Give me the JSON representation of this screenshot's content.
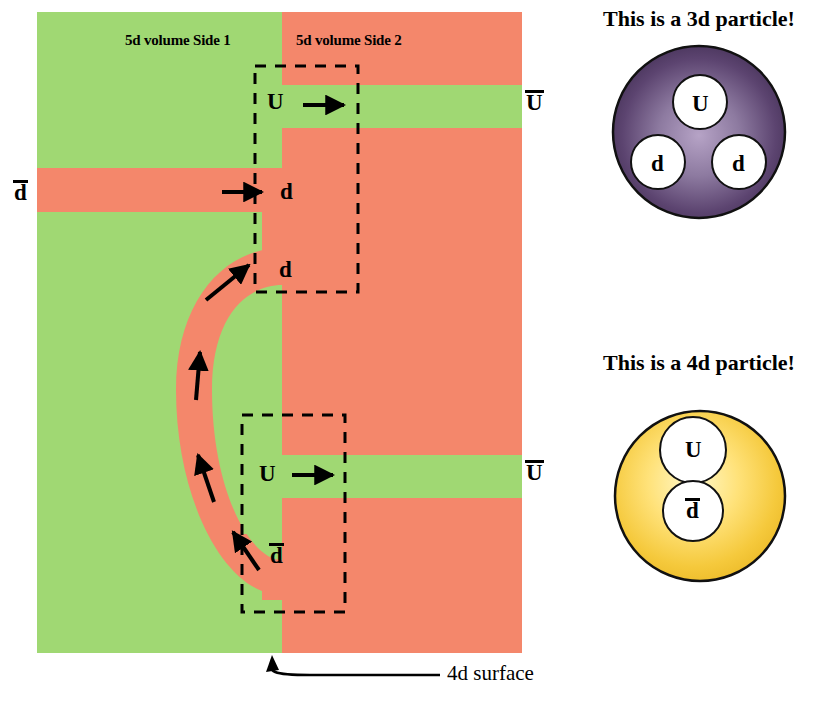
{
  "figure": {
    "type": "physics-schematic",
    "colors": {
      "side1_green": "#a0d873",
      "side2_salmon": "#f4876b",
      "outline": "#000000",
      "particle_3d_gradient_light": "#9b86ad",
      "particle_3d_gradient_dark": "#3d2b4f",
      "particle_4d_gradient_light": "#fff4b0",
      "particle_4d_gradient_dark": "#e8b321",
      "background": "#ffffff"
    }
  },
  "main_panel": {
    "side1_label": "5d volume Side 1",
    "side2_label": "5d volume Side 2",
    "surface_label": "4d surface"
  },
  "flux_labels": {
    "u_top_inner": "U",
    "u_top_outer": "U",
    "d_bar_left": "d",
    "d_mid_upper": "d",
    "d_mid_lower": "d",
    "u_bottom_inner": "U",
    "u_bottom_outer": "U",
    "d_bar_bottom": "d"
  },
  "particles": [
    {
      "caption": "This is a 3d particle!",
      "kind": "3d",
      "constituents": [
        {
          "label": "U",
          "bar": false,
          "position": "top"
        },
        {
          "label": "d",
          "bar": false,
          "position": "bottom-left"
        },
        {
          "label": "d",
          "bar": false,
          "position": "bottom-right"
        }
      ]
    },
    {
      "caption": "This is a 4d particle!",
      "kind": "4d",
      "constituents": [
        {
          "label": "U",
          "bar": false,
          "position": "top"
        },
        {
          "label": "d",
          "bar": true,
          "position": "bottom"
        }
      ]
    }
  ]
}
